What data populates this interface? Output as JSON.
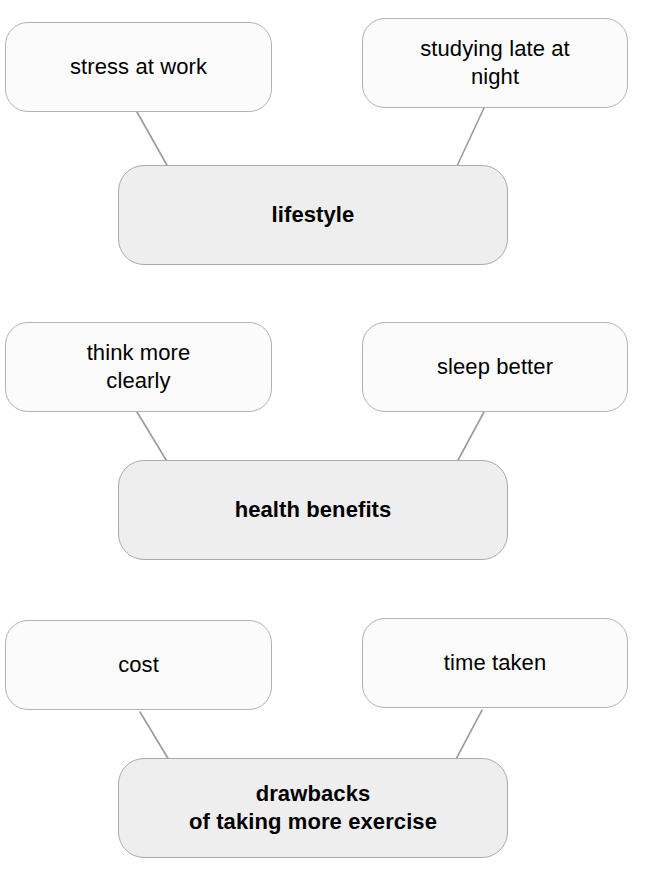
{
  "diagram": {
    "type": "mind-map",
    "background_color": "#ffffff",
    "node_fill_leaf": "#fbfbfb",
    "node_fill_root": "#eeeeee",
    "node_border_color": "#b2b2b2",
    "connector_color": "#9a9a9a",
    "text_color": "#000000",
    "clusters": [
      {
        "id": "lifestyle",
        "root": {
          "label": "lifestyle",
          "label_line2": ""
        },
        "leaves": [
          {
            "label": "stress at work",
            "label_line2": ""
          },
          {
            "label": "studying late at",
            "label_line2": "night"
          }
        ]
      },
      {
        "id": "health-benefits",
        "root": {
          "label": "health benefits",
          "label_line2": ""
        },
        "leaves": [
          {
            "label": "think more",
            "label_line2": "clearly"
          },
          {
            "label": "sleep better",
            "label_line2": ""
          }
        ]
      },
      {
        "id": "drawbacks",
        "root": {
          "label": "drawbacks",
          "label_line2": "of taking more exercise"
        },
        "leaves": [
          {
            "label": "cost",
            "label_line2": ""
          },
          {
            "label": "time taken",
            "label_line2": ""
          }
        ]
      }
    ]
  }
}
